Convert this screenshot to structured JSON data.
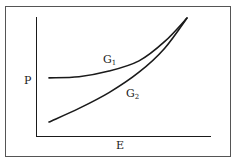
{
  "chart_data": {
    "type": "line",
    "title": "",
    "xlabel": "E",
    "ylabel": "P",
    "grid": false,
    "legend": "inline labels",
    "x_ticks": [],
    "y_ticks": [],
    "series": [
      {
        "name": "G1",
        "label_main": "G",
        "label_sub": "1",
        "points": [
          [
            0.0,
            0.47
          ],
          [
            0.2,
            0.48
          ],
          [
            0.4,
            0.53
          ],
          [
            0.6,
            0.62
          ],
          [
            0.77,
            0.79
          ],
          [
            0.92,
            1.0
          ]
        ]
      },
      {
        "name": "G2",
        "label_main": "G",
        "label_sub": "2",
        "points": [
          [
            0.0,
            0.08
          ],
          [
            0.2,
            0.2
          ],
          [
            0.4,
            0.34
          ],
          [
            0.6,
            0.52
          ],
          [
            0.77,
            0.73
          ],
          [
            0.92,
            1.0
          ]
        ]
      }
    ],
    "annotations": [
      "Curves G1 and G2 converge at high E"
    ]
  },
  "colors": {
    "stroke": "#1a1a1a",
    "frame": "#555555",
    "background": "#ffffff"
  }
}
